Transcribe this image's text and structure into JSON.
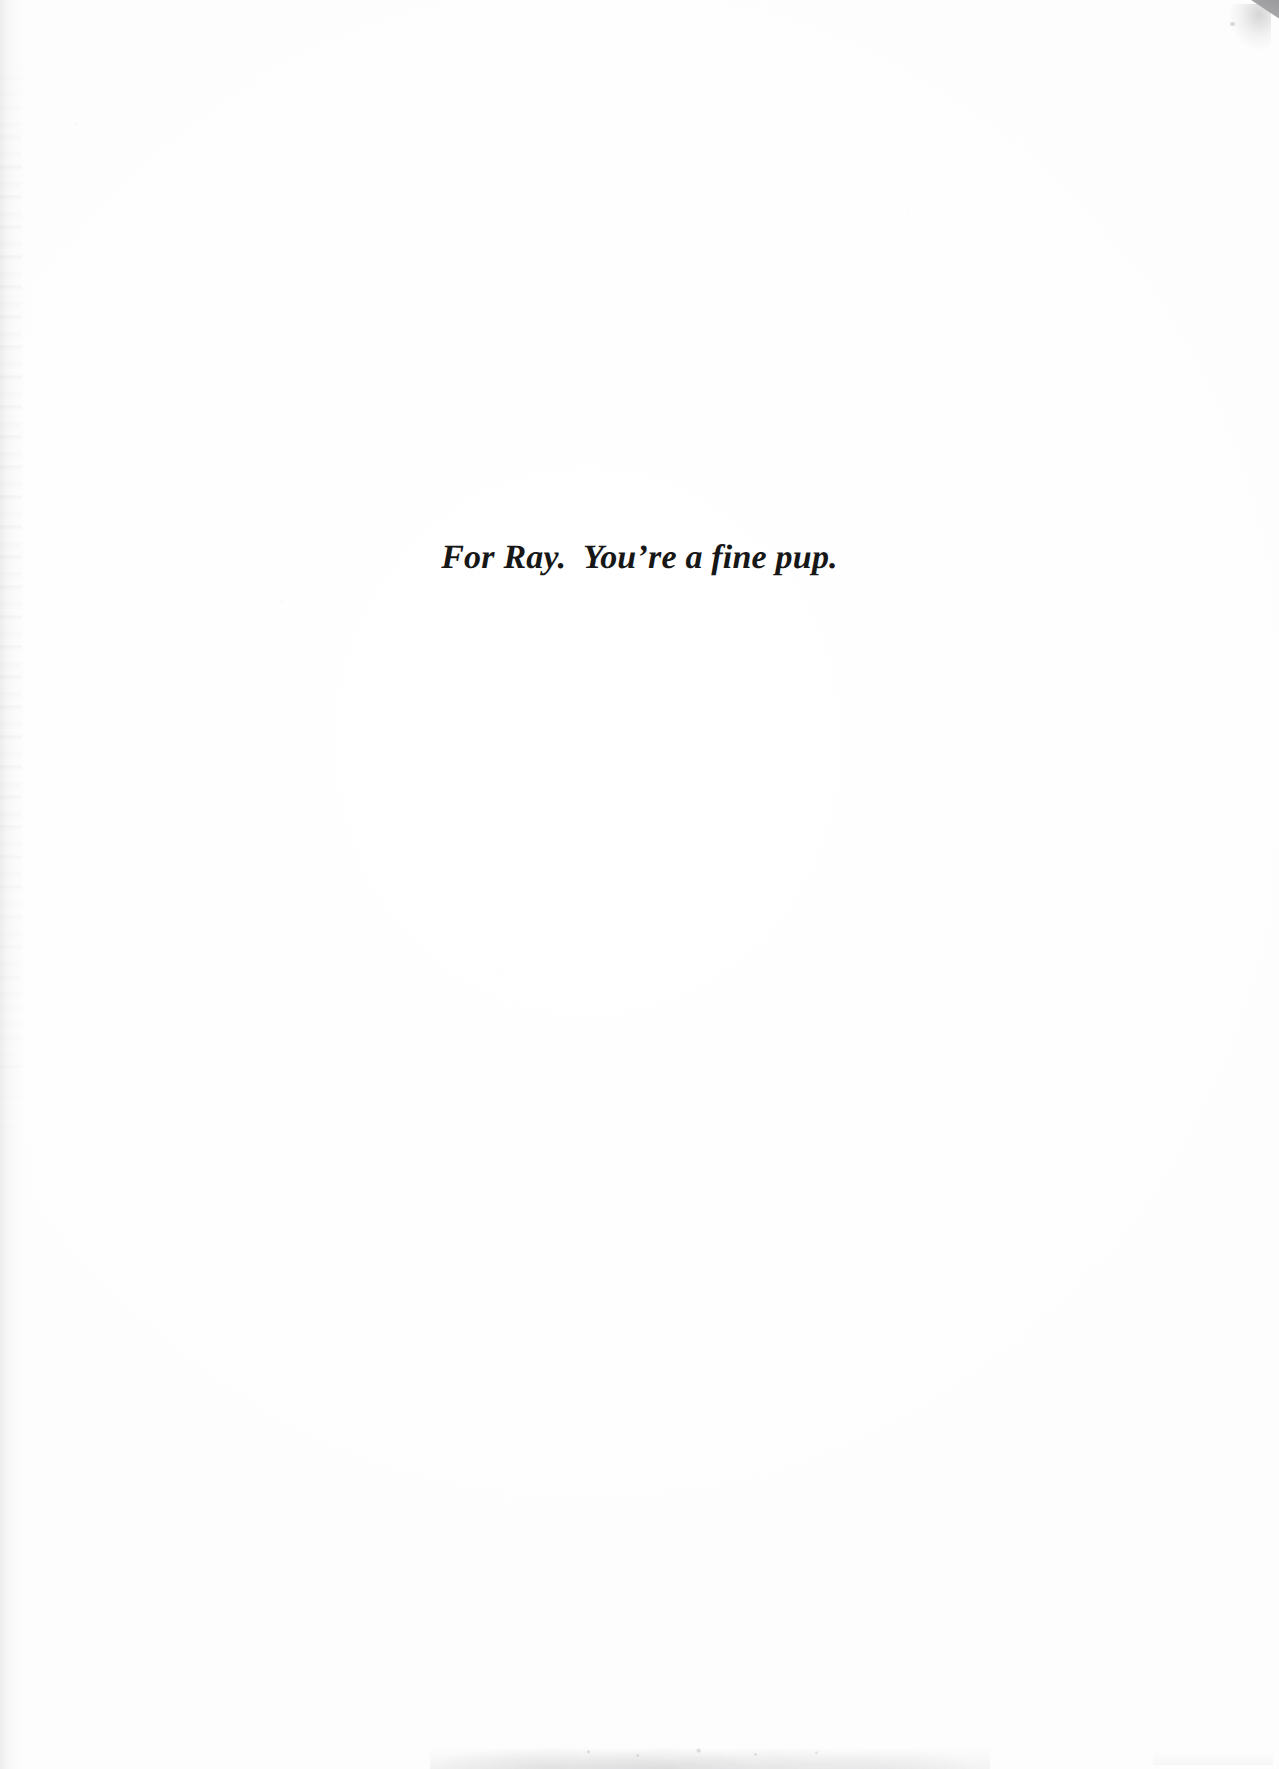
{
  "page": {
    "kind": "scanned-book-dedication-page",
    "background_color": "#fefefe",
    "text_color": "#171717",
    "width": 1279,
    "height": 1769
  },
  "dedication": {
    "text": "For Ray.  You’re a fine pup.",
    "alignment": "center",
    "style": "bold-italic-serif",
    "font_size_px": 34
  },
  "artifacts": {
    "corner_fold_top_right": {
      "name": "grey-diagonal-wedge",
      "color": "#9a9a9c"
    },
    "gutter_shadow_left": {
      "name": "left-edge-scan-band",
      "color": "#96969a"
    },
    "edge_smudge_bottom": {
      "name": "bottom-edge-smudge",
      "color": "#b2b2b6"
    }
  }
}
